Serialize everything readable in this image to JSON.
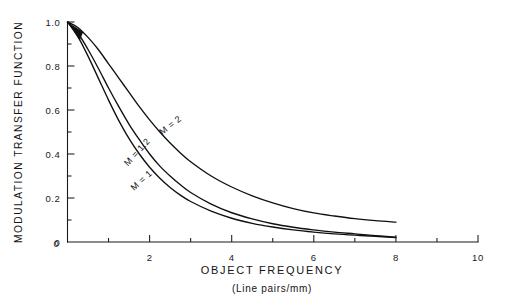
{
  "figure": {
    "background_color": "#ffffff",
    "ink_color": "#101010"
  },
  "axes": {
    "x": {
      "title": "OBJECT FREQUENCY",
      "subtitle": "(Line pairs/mm)",
      "tick_labels": [
        "0",
        "2",
        "4",
        "6",
        "8",
        "10"
      ],
      "tick_values": [
        0,
        2,
        4,
        6,
        8,
        10
      ],
      "minor_tick_values": [
        1,
        3,
        5,
        7,
        9
      ],
      "range": [
        0,
        10
      ]
    },
    "y": {
      "title": "MODULATION TRANSFER FUNCTION",
      "tick_labels": [
        "0",
        "0.2",
        "0.4",
        "0.6",
        "0.8",
        "1.0"
      ],
      "tick_values": [
        0,
        0.2,
        0.4,
        0.6,
        0.8,
        1.0
      ],
      "minor_tick_values": [
        0.1,
        0.3,
        0.5,
        0.7,
        0.9
      ],
      "range": [
        0,
        1.0
      ]
    }
  },
  "curve_labels": [
    {
      "text": "M = 2",
      "x": 2.55,
      "y": 0.52,
      "angle": -38
    },
    {
      "text": "M = 1.2",
      "x": 1.75,
      "y": 0.4,
      "angle": -48
    },
    {
      "text": "M = 1",
      "x": 1.85,
      "y": 0.27,
      "angle": -42
    }
  ],
  "chart_data": {
    "type": "line",
    "title": "",
    "xlabel": "OBJECT FREQUENCY (Line pairs/mm)",
    "ylabel": "MODULATION TRANSFER FUNCTION",
    "xlim": [
      0,
      10
    ],
    "ylim": [
      0,
      1.0
    ],
    "grid": false,
    "legend": "inline curve labels",
    "x": [
      0,
      0.25,
      0.5,
      0.75,
      1.0,
      1.25,
      1.5,
      1.75,
      2.0,
      2.25,
      2.5,
      2.75,
      3.0,
      3.5,
      4.0,
      4.5,
      5.0,
      5.5,
      6.0,
      6.5,
      7.0,
      7.5,
      8.0
    ],
    "series": [
      {
        "name": "M = 2",
        "values": [
          1.0,
          0.975,
          0.93,
          0.875,
          0.81,
          0.745,
          0.68,
          0.615,
          0.555,
          0.5,
          0.45,
          0.405,
          0.365,
          0.3,
          0.25,
          0.21,
          0.178,
          0.152,
          0.132,
          0.118,
          0.106,
          0.097,
          0.09
        ]
      },
      {
        "name": "M = 1.2",
        "values": [
          1.0,
          0.95,
          0.875,
          0.79,
          0.7,
          0.615,
          0.535,
          0.465,
          0.4,
          0.345,
          0.3,
          0.26,
          0.225,
          0.172,
          0.133,
          0.105,
          0.083,
          0.067,
          0.055,
          0.045,
          0.037,
          0.029,
          0.022
        ]
      },
      {
        "name": "M = 1",
        "values": [
          1.0,
          0.935,
          0.845,
          0.745,
          0.645,
          0.552,
          0.47,
          0.4,
          0.34,
          0.29,
          0.248,
          0.213,
          0.184,
          0.14,
          0.108,
          0.085,
          0.068,
          0.055,
          0.045,
          0.037,
          0.031,
          0.026,
          0.02
        ]
      }
    ]
  }
}
